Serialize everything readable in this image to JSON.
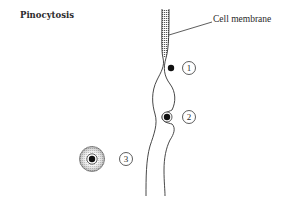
{
  "title": "Pinocytosis",
  "labels": {
    "membrane": "Cell membrane"
  },
  "stages": [
    {
      "id": 1,
      "label": "1",
      "description": "particle approaching membrane"
    },
    {
      "id": 2,
      "label": "2",
      "description": "particle engulfed in membrane invagination"
    },
    {
      "id": 3,
      "label": "3",
      "description": "vesicle pinched off inside cell"
    }
  ],
  "colors": {
    "ink": "#2a2a2a",
    "background": "#ffffff"
  }
}
